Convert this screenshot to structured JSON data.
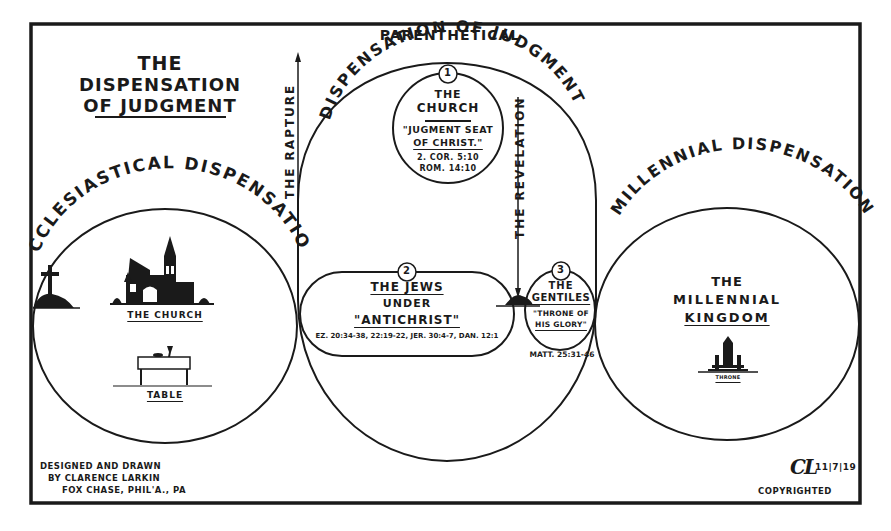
{
  "title": {
    "line1": "THE",
    "line2": "DISPENSATION",
    "line3": "OF JUDGMENT"
  },
  "top_heading": "PARENTHETICAL",
  "dispensations": {
    "left": {
      "arc_label": "ECCLESIASTICAL DISPENSATION",
      "church_label": "THE CHURCH",
      "table_label": "TABLE"
    },
    "middle": {
      "arc_label": "DISPENSATION OF JUDGMENT"
    },
    "right": {
      "arc_label": "MILLENNIAL DISPENSATION",
      "line1": "THE",
      "line2": "MILLENNIAL",
      "line3": "KINGDOM",
      "throne_label": "THRONE"
    }
  },
  "arrows": {
    "rapture": "THE RAPTURE",
    "revelation": "THE REVELATION"
  },
  "judgments": [
    {
      "number": "1",
      "line1": "THE",
      "line2": "CHURCH",
      "quote1": "\"JUGMENT SEAT",
      "quote2": "OF CHRIST.\"",
      "ref1": "2. COR. 5:10",
      "ref2": "ROM. 14:10"
    },
    {
      "number": "2",
      "line1": "THE JEWS",
      "line2": "UNDER",
      "line3": "\"ANTICHRIST\"",
      "ref": "EZ. 20:34-38, 22:19-22, JER. 30:4-7, DAN. 12:1"
    },
    {
      "number": "3",
      "line1": "THE",
      "line2": "GENTILES",
      "quote1": "\"THRONE OF",
      "quote2": "HIS GLORY\"",
      "ref": "MATT. 25:31-46"
    }
  ],
  "credits": {
    "line1": "DESIGNED AND DRAWN",
    "line2": "BY CLARENCE LARKIN",
    "line3": "FOX CHASE, PHIL'A., PA"
  },
  "signature": {
    "monogram": "CL",
    "date": "11|7|19",
    "copyright": "COPYRIGHTED"
  },
  "colors": {
    "ink": "#1a1a1a",
    "paper": "#ffffff"
  }
}
